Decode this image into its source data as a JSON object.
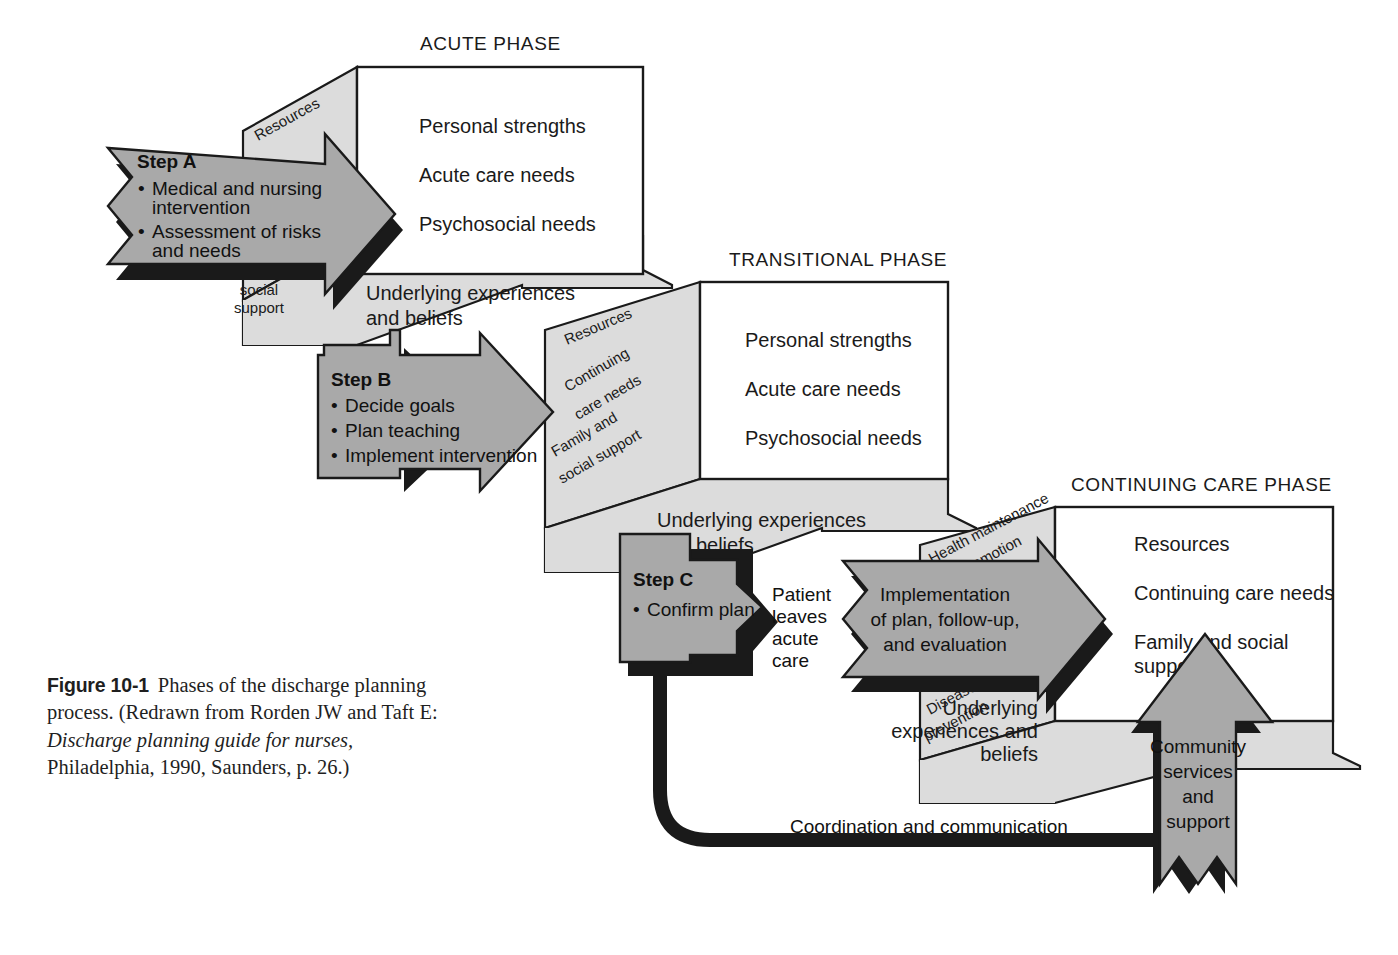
{
  "figure": {
    "number_label": "Figure 10-1",
    "caption_part1": "Phases of the discharge planning process. (Redrawn from Rorden JW and Taft E: ",
    "caption_italic": "Discharge planning guide for nurses,",
    "caption_part2": " Philadelphia, 1990, Saunders, p. 26.)"
  },
  "colors": {
    "arrow_fill": "#a9a9a9",
    "panel_fill": "#dcdcdc",
    "box_fill": "#ffffff",
    "outline": "#1a1a1a",
    "shadow": "#1a1a1a",
    "text": "#1a1a1a",
    "page_background": "#ffffff"
  },
  "phases": [
    {
      "id": "acute",
      "title": "ACUTE PHASE",
      "front_items": [
        "Personal strengths",
        "Acute care needs",
        "Psychosocial needs"
      ],
      "bottom_label": [
        "Underlying experiences",
        "and beliefs"
      ],
      "side_labels": [
        "Resources",
        "Family and",
        "social",
        "support"
      ]
    },
    {
      "id": "transitional",
      "title": "TRANSITIONAL PHASE",
      "front_items": [
        "Personal strengths",
        "Acute care needs",
        "Psychosocial needs"
      ],
      "bottom_label": [
        "Underlying experiences",
        "and beliefs"
      ],
      "side_labels": [
        "Resources",
        "Continuing",
        "care needs",
        "Family and",
        "social support"
      ]
    },
    {
      "id": "continuing-care",
      "title": "CONTINUING CARE PHASE",
      "front_items": [
        "Resources",
        "Continuing care needs",
        "Family and social",
        "supports"
      ],
      "bottom_label": [
        "Underlying",
        "experiences and",
        "beliefs"
      ],
      "side_labels": [
        "Health maintenance",
        "and promotion",
        "Disease",
        "prevention"
      ]
    }
  ],
  "steps": [
    {
      "id": "step-a",
      "title": "Step A",
      "items": [
        "Medical and nursing",
        "intervention",
        "Assessment of risks",
        "and needs"
      ]
    },
    {
      "id": "step-b",
      "title": "Step B",
      "items": [
        "Decide goals",
        "Plan teaching",
        "Implement intervention"
      ]
    },
    {
      "id": "step-c",
      "title": "Step C",
      "items": [
        "Confirm plan"
      ]
    }
  ],
  "flow_labels": {
    "patient_leaves": [
      "Patient",
      "leaves",
      "acute",
      "care"
    ],
    "implementation_arrow": [
      "Implementation",
      "of plan, follow-up,",
      "and evaluation"
    ],
    "community_arrow": [
      "Community",
      "services",
      "and",
      "support"
    ],
    "coordination": "Coordination and communication"
  }
}
